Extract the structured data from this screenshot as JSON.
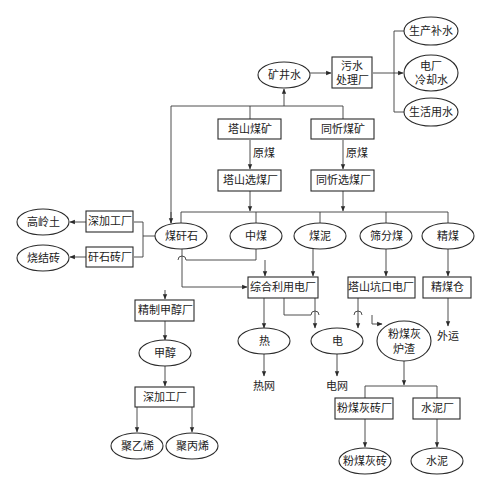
{
  "diagram": {
    "water": {
      "mine_water": "矿井水",
      "treatment_plant": [
        "污水",
        "处理厂"
      ],
      "outputs": [
        "生产补水",
        [
          "电厂",
          "冷却水"
        ],
        "生活用水"
      ]
    },
    "mines": {
      "tashan_mine": "塔山煤矿",
      "tongxin_mine": "同忻煤矿",
      "raw_coal_label": "原煤",
      "tashan_prep": "塔山选煤厂",
      "tongxin_prep": "同忻选煤厂"
    },
    "products": [
      "煤矸石",
      "中煤",
      "煤泥",
      "筛分煤",
      "精煤"
    ],
    "gangue": {
      "deep_processing": "深加工厂",
      "brick_plant": "矸石砖厂",
      "kaolin": "高岭土",
      "sintered_brick": "烧结砖"
    },
    "plants": {
      "comprehensive_power": "综合利用电厂",
      "tashan_mine_mouth_power": "塔山坑口电厂",
      "clean_coal_bin": "精煤仓",
      "export_label": "外运"
    },
    "methanol": {
      "refinery": "精制甲醇厂",
      "methanol": "甲醇",
      "deep_processing": "深加工厂",
      "polyethylene": "聚乙烯",
      "polypropylene": "聚丙烯"
    },
    "energy": {
      "heat": "热",
      "electricity": "电",
      "ash_slag": [
        "粉煤灰",
        "炉渣"
      ],
      "heat_network": "热网",
      "power_grid": "电网"
    },
    "ash": {
      "ash_brick_plant": "粉煤灰砖厂",
      "cement_plant": "水泥厂",
      "ash_brick": "粉煤灰砖",
      "cement": "水泥"
    }
  },
  "colors": {
    "line": "#3a3a3a",
    "text": "#222222",
    "background": "#ffffff"
  }
}
